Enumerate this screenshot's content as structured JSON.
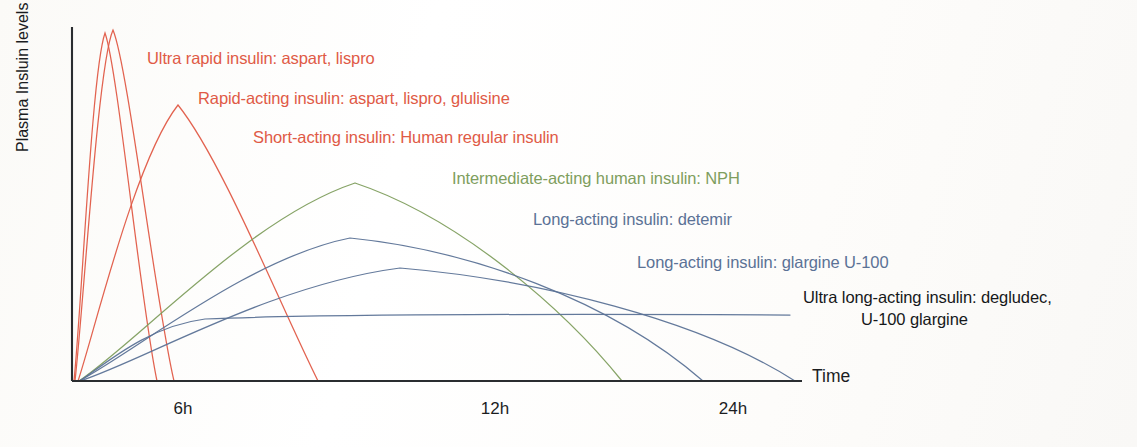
{
  "figure": {
    "background_color": "#fdfdfb",
    "axis_color": "#2a2d30"
  },
  "axes": {
    "y_label": "Plasma Insluin levels",
    "x_label": "Time",
    "x_ticks": [
      {
        "label": "6h",
        "x": 183
      },
      {
        "label": "12h",
        "x": 495
      },
      {
        "label": "24h",
        "x": 733
      }
    ],
    "x_axis_y": 381,
    "y_axis_x": 72,
    "y_axis_top": 27,
    "x_axis_end": 802
  },
  "colors": {
    "red": "#e05a46",
    "green": "#7f9e5e",
    "blue": "#5b7296",
    "black": "#16181a"
  },
  "labels": [
    {
      "text": "Ultra rapid insulin: aspart, lispro",
      "color_key": "red",
      "x": 147,
      "y": 48,
      "name": "label-ultra-rapid-insulin"
    },
    {
      "text": "Rapid-acting insulin: aspart, lispro, glulisine",
      "color_key": "red",
      "x": 198,
      "y": 88,
      "name": "label-rapid-acting-insulin"
    },
    {
      "text": "Short-acting insulin: Human regular insulin",
      "color_key": "red",
      "x": 253,
      "y": 127,
      "name": "label-short-acting-insulin"
    },
    {
      "text": "Intermediate-acting human insulin: NPH",
      "color_key": "green",
      "x": 452,
      "y": 168,
      "name": "label-intermediate-acting-nph"
    },
    {
      "text": "Long-acting insulin: detemir",
      "color_key": "blue",
      "x": 533,
      "y": 209,
      "name": "label-long-acting-detemir"
    },
    {
      "text": "Long-acting insulin: glargine U-100",
      "color_key": "blue",
      "x": 637,
      "y": 252,
      "name": "label-long-acting-glargine-u100"
    },
    {
      "text": "Ultra long-acting insulin: degludec,",
      "color_key": "black",
      "x": 803,
      "y": 287,
      "name": "label-ultra-long-acting-degludec"
    },
    {
      "text": "U-100 glargine",
      "color_key": "black",
      "x": 861,
      "y": 309,
      "name": "label-u100-glargine"
    }
  ],
  "chart_data": {
    "type": "line",
    "title": "",
    "xlabel": "Time",
    "ylabel": "Plasma Insluin levels",
    "xlim": [
      0,
      28
    ],
    "ylim": [
      0,
      100
    ],
    "grid": false,
    "legend": "inline-annotations",
    "x_tick_values": [
      6,
      12,
      24
    ],
    "x_tick_labels": [
      "6h",
      "12h",
      "24h"
    ],
    "series": [
      {
        "name": "Ultra rapid insulin: aspart, lispro",
        "color": "#e05a46",
        "onset_h": 0.1,
        "peak_h": 1.0,
        "peak_level": 99,
        "duration_h": 2.6,
        "path": "M 74,381 C 82,300 92,70 105,33 C 118,70 140,300 157,381"
      },
      {
        "name": "Rapid-acting insulin: aspart, lispro, glulisine",
        "color": "#e05a46",
        "onset_h": 0.2,
        "peak_h": 1.2,
        "peak_level": 100,
        "duration_h": 3.2,
        "path": "M 75,381 C 84,300 98,64 113,30 C 128,66 155,300 174,381"
      },
      {
        "name": "Short-acting insulin: Human regular insulin",
        "color": "#e05a46",
        "onset_h": 0.5,
        "peak_h": 2.6,
        "peak_level": 79,
        "duration_h": 8.0,
        "path": "M 78,381 C 95,330 135,160 178,105 C 222,160 280,305 318,381"
      },
      {
        "name": "Intermediate-acting human insulin: NPH",
        "color": "#7f9e5e",
        "onset_h": 1.5,
        "peak_h": 7.5,
        "peak_level": 56,
        "duration_h": 16.5,
        "path": "M 79,381 C 140,340 250,218 355,183 C 460,218 565,310 622,381"
      },
      {
        "name": "Long-acting insulin: detemir",
        "color": "#5b7296",
        "onset_h": 1.5,
        "peak_h": 7.2,
        "peak_level": 41,
        "duration_h": 19.5,
        "path": "M 79,381 C 140,348 250,258 350,238 C 470,250 610,300 703,381"
      },
      {
        "name": "Long-acting insulin: glargine U-100",
        "color": "#5b7296",
        "onset_h": 2.0,
        "peak_h": 9.0,
        "peak_level": 31,
        "duration_h": 23.5,
        "path": "M 80,381 C 145,360 270,285 400,268 C 540,280 700,320 795,381"
      },
      {
        "name": "Ultra long-acting insulin: degludec, U-100 glargine",
        "color": "#5b7296",
        "onset_h": 1.0,
        "peak_h": null,
        "peak_level": 18,
        "duration_h": 28,
        "path": "M 80,381 C 110,360 150,326 205,319 C 330,314 600,314 790,315"
      }
    ]
  }
}
